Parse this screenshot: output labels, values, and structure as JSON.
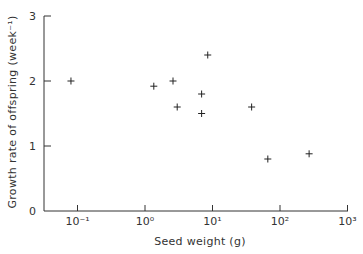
{
  "chart_data": {
    "type": "scatter",
    "title": "",
    "xlabel": "Seed weight (g)",
    "ylabel": "Growth rate of offspring (week⁻¹)",
    "xscale": "log",
    "xlim": [
      0.05,
      1000
    ],
    "ylim": [
      0,
      3
    ],
    "grid": false,
    "legend": null,
    "marker": "plus",
    "x_ticks": [
      {
        "value": 0.1,
        "label": "10⁻¹"
      },
      {
        "value": 1,
        "label": "10⁰"
      },
      {
        "value": 10,
        "label": "10¹"
      },
      {
        "value": 100,
        "label": "10²"
      },
      {
        "value": 1000,
        "label": "10³"
      }
    ],
    "y_ticks": [
      {
        "value": 0,
        "label": "0"
      },
      {
        "value": 1,
        "label": "1"
      },
      {
        "value": 2,
        "label": "2"
      },
      {
        "value": 3,
        "label": "3"
      }
    ],
    "series": [
      {
        "name": "species",
        "points": [
          {
            "x": 0.08,
            "y": 2.0
          },
          {
            "x": 1.35,
            "y": 1.92
          },
          {
            "x": 2.6,
            "y": 2.0
          },
          {
            "x": 3.0,
            "y": 1.6
          },
          {
            "x": 6.9,
            "y": 1.8
          },
          {
            "x": 6.9,
            "y": 1.5
          },
          {
            "x": 8.5,
            "y": 2.4
          },
          {
            "x": 38,
            "y": 1.6
          },
          {
            "x": 66,
            "y": 0.8
          },
          {
            "x": 270,
            "y": 0.88
          }
        ]
      }
    ]
  }
}
